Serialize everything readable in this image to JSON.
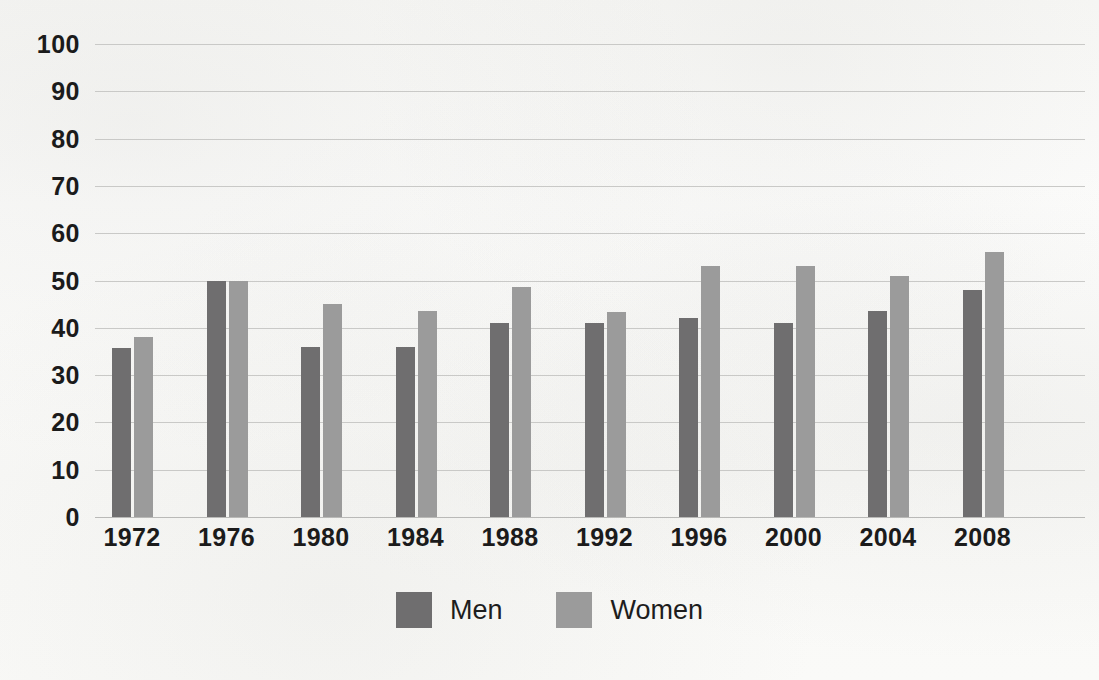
{
  "chart_data": {
    "type": "bar",
    "title": "",
    "subtitle": "",
    "xlabel": "",
    "ylabel": "",
    "ylim": [
      0,
      100
    ],
    "ytick_step": 10,
    "yticks": [
      100,
      90,
      80,
      70,
      60,
      50,
      40,
      30,
      20,
      10,
      0
    ],
    "grid": true,
    "legend_position": "bottom-center",
    "categories": [
      "1972",
      "1976",
      "1980",
      "1984",
      "1988",
      "1992",
      "1996",
      "2000",
      "2004",
      "2008"
    ],
    "series": [
      {
        "name": "Men",
        "color": "#6f6e6f",
        "values": [
          35.7,
          50.0,
          35.9,
          36.0,
          41.0,
          41.0,
          42.0,
          41.0,
          43.5,
          48.0
        ]
      },
      {
        "name": "Women",
        "color": "#9b9b9b",
        "values": [
          38.0,
          50.0,
          45.0,
          43.5,
          48.7,
          43.4,
          53.0,
          53.0,
          51.0,
          56.0
        ]
      }
    ]
  },
  "legend": {
    "items": [
      {
        "label": "Men",
        "color": "#6f6e6f"
      },
      {
        "label": "Women",
        "color": "#9b9b9b"
      }
    ]
  },
  "colors": {
    "men": "#6f6e6f",
    "women": "#9b9b9b",
    "gridline": "#c9c9c7",
    "axis_text": "#1b1b1b",
    "background": "#fbfbfa"
  }
}
